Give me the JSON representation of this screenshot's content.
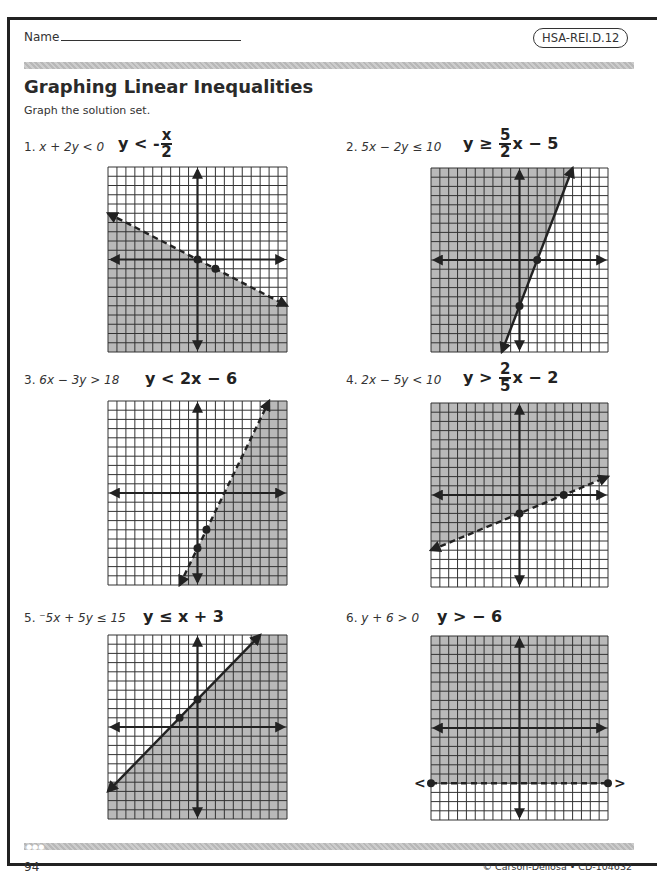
{
  "header": {
    "name_label": "Name",
    "standard": "HSA-REI.D.12"
  },
  "title": "Graphing Linear Inequalities",
  "instructions": "Graph the solution set.",
  "problems": [
    {
      "number": "1.",
      "inequality": "x + 2y < 0",
      "answer_prefix": "y < -",
      "answer_num": "x",
      "answer_den": "2",
      "answer_suffix": ""
    },
    {
      "number": "2.",
      "inequality": "5x − 2y ≤ 10",
      "answer_prefix": "y ≥ ",
      "answer_num": "5",
      "answer_den": "2",
      "answer_suffix": "x − 5"
    },
    {
      "number": "3.",
      "inequality": "6x − 3y > 18",
      "answer_text": "y < 2x − 6"
    },
    {
      "number": "4.",
      "inequality": "2x − 5y < 10",
      "answer_prefix": "y > ",
      "answer_num": "2",
      "answer_den": "5",
      "answer_suffix": "x − 2"
    },
    {
      "number": "5.",
      "inequality": "⁻5x + 5y ≤ 15",
      "answer_text": "y ≤ x + 3"
    },
    {
      "number": "6.",
      "inequality": "y + 6 > 0",
      "answer_text": "y > − 6"
    }
  ],
  "chart_data": [
    {
      "type": "line",
      "title": "1. y < -x/2",
      "xlim": [
        -10,
        10
      ],
      "ylim": [
        -10,
        10
      ],
      "grid": true,
      "slope": -0.5,
      "intercept": 0,
      "boundary": "dashed",
      "shade": "below",
      "points": [
        [
          0,
          0
        ],
        [
          2,
          -1
        ]
      ],
      "line_ends": [
        [
          -10,
          5
        ],
        [
          10,
          -5
        ]
      ]
    },
    {
      "type": "line",
      "title": "2. y ≥ 5/2 x − 5",
      "xlim": [
        -10,
        10
      ],
      "ylim": [
        -10,
        10
      ],
      "grid": true,
      "slope": 2.5,
      "intercept": -5,
      "boundary": "solid",
      "shade": "above",
      "points": [
        [
          0,
          -5
        ],
        [
          2,
          0
        ]
      ],
      "line_ends": [
        [
          -2,
          -10
        ],
        [
          6,
          10
        ]
      ]
    },
    {
      "type": "line",
      "title": "3. y < 2x − 6",
      "xlim": [
        -10,
        10
      ],
      "ylim": [
        -10,
        10
      ],
      "grid": true,
      "slope": 2,
      "intercept": -6,
      "boundary": "dashed",
      "shade": "below",
      "points": [
        [
          1,
          -4
        ],
        [
          0,
          -6
        ]
      ],
      "line_ends": [
        [
          -2,
          -10
        ],
        [
          8,
          10
        ]
      ]
    },
    {
      "type": "line",
      "title": "4. y > 2/5 x − 2",
      "xlim": [
        -10,
        10
      ],
      "ylim": [
        -10,
        10
      ],
      "grid": true,
      "slope": 0.4,
      "intercept": -2,
      "boundary": "dashed",
      "shade": "above",
      "points": [
        [
          0,
          -2
        ],
        [
          5,
          0
        ]
      ],
      "line_ends": [
        [
          -10,
          -6
        ],
        [
          10,
          2
        ]
      ]
    },
    {
      "type": "line",
      "title": "5. y ≤ x + 3",
      "xlim": [
        -10,
        10
      ],
      "ylim": [
        -10,
        10
      ],
      "grid": true,
      "slope": 1,
      "intercept": 3,
      "boundary": "solid",
      "shade": "below",
      "points": [
        [
          -2,
          1
        ],
        [
          0,
          3
        ]
      ],
      "line_ends": [
        [
          -10,
          -7
        ],
        [
          7,
          10
        ]
      ]
    },
    {
      "type": "line",
      "title": "6. y > −6",
      "xlim": [
        -10,
        10
      ],
      "ylim": [
        -10,
        10
      ],
      "grid": true,
      "slope": 0,
      "intercept": -6,
      "boundary": "dashed",
      "shade": "above",
      "points": [
        [
          -10,
          -6
        ],
        [
          10,
          -6
        ]
      ],
      "line_ends": [
        [
          -11,
          -6
        ],
        [
          11,
          -6
        ]
      ]
    }
  ],
  "footer": {
    "page_number": "94",
    "copyright": "© Carson-Dellosa • CD-104632"
  },
  "colors": {
    "shade": "#b9b9b9",
    "grid": "#333333",
    "ink": "#222222"
  }
}
